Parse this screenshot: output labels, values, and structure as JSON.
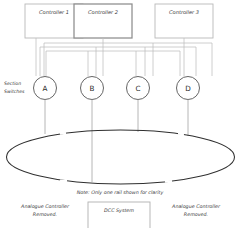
{
  "diagram": {
    "title_note": "Note: Only one rail shown for clarity",
    "controllers": [
      {
        "label": "Controller 1"
      },
      {
        "label": "Controller 2"
      },
      {
        "label": "Controller 3"
      }
    ],
    "section_switch_label_line1": "Section",
    "section_switch_label_line2": "Switches",
    "switches": [
      {
        "label": "A"
      },
      {
        "label": "B"
      },
      {
        "label": "C"
      },
      {
        "label": "D"
      }
    ],
    "footer": {
      "left": {
        "line1": "Analogue Controller",
        "line2": "Removed."
      },
      "center": {
        "label": "DCC System"
      },
      "right": {
        "line1": "Analogue Controller",
        "line2": "Removed."
      }
    },
    "colors": {
      "track": "#2f2f2f",
      "wire": "#bdbdbd",
      "box_border": "#b9b9b9",
      "box_border_highlight": "#8d8d8d",
      "switch_border": "#555555",
      "text": "#3a3a3a",
      "background": "#ffffff"
    }
  }
}
